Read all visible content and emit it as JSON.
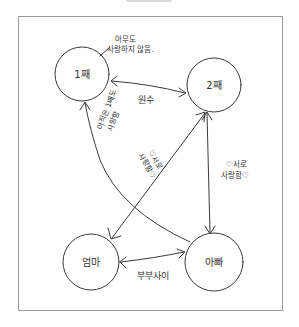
{
  "diagram": {
    "title_cropped": true,
    "nodes": [
      {
        "id": "first-child",
        "label": "1째",
        "cx": 82,
        "cy": 74,
        "r": 27
      },
      {
        "id": "second-child",
        "label": "2째",
        "cx": 214,
        "cy": 85,
        "r": 27
      },
      {
        "id": "mom",
        "label": "엄마",
        "cx": 91,
        "cy": 262,
        "r": 28
      },
      {
        "id": "dad",
        "label": "아빠",
        "cx": 214,
        "cy": 262,
        "r": 29
      }
    ],
    "edges": [
      {
        "id": "first-second",
        "from": "first-child",
        "to": "second-child",
        "direction": "both",
        "label": "원수"
      },
      {
        "id": "dad-first",
        "from": "dad",
        "to": "first-child",
        "direction": "to",
        "label": "아직은 1째도 사랑함"
      },
      {
        "id": "mom-second",
        "from": "mom",
        "to": "second-child",
        "direction": "both",
        "label": "♡서로 사랑함♡"
      },
      {
        "id": "second-dad",
        "from": "second-child",
        "to": "dad",
        "direction": "both",
        "label": "♡서로 사랑함♡"
      },
      {
        "id": "mom-dad",
        "from": "mom",
        "to": "dad",
        "direction": "both",
        "label": "부부사이"
      }
    ],
    "notes": {
      "first_child_note_line1": "아무도",
      "first_child_note_line2": "사랑하지 않음.",
      "dad_first_line1": "아직은 1째도",
      "dad_first_line2": "사랑함",
      "center_love_line1": "♡서로",
      "center_love_line2": "사랑함♡",
      "right_love_line1": "♡서로",
      "right_love_line2": "사랑함♡",
      "enemy": "원수",
      "couple": "부부사이"
    },
    "colors": {
      "ink": "#3a3a3a",
      "frame": "#9a9a9a",
      "background": "#ffffff"
    }
  }
}
